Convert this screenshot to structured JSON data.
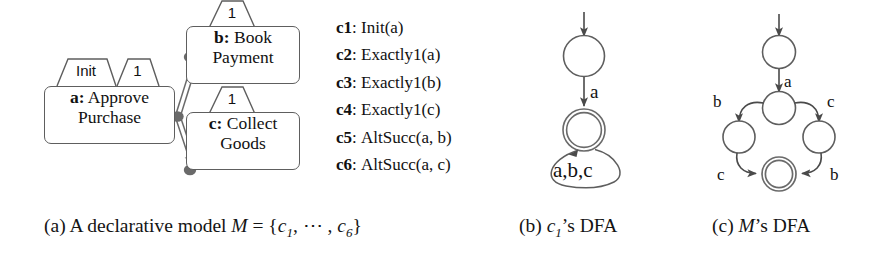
{
  "figure": {
    "background": "#ffffff",
    "line_color": "#5e5e5e",
    "text_color": "#111111"
  },
  "panel_a": {
    "activities": [
      {
        "id": "a",
        "id_label": "a:",
        "line1": " Approve",
        "line2": "Purchase",
        "tabs": [
          "Init",
          "1"
        ]
      },
      {
        "id": "b",
        "id_label": "b:",
        "line1": " Book",
        "line2": "Payment",
        "tabs": [
          "1"
        ]
      },
      {
        "id": "c",
        "id_label": "c:",
        "line1": " Collect",
        "line2": "Goods",
        "tabs": [
          "1"
        ]
      }
    ],
    "relations": [
      {
        "from": "a",
        "to": "b",
        "type": "alternate-succession"
      },
      {
        "from": "a",
        "to": "c",
        "type": "alternate-succession"
      }
    ],
    "constraints": [
      {
        "id": "c1",
        "sep": ":",
        "text": "Init(a)"
      },
      {
        "id": "c2",
        "sep": ":",
        "text": "Exactly1(a)"
      },
      {
        "id": "c3",
        "sep": ":",
        "text": "Exactly1(b)"
      },
      {
        "id": "c4",
        "sep": ":",
        "text": "Exactly1(c)"
      },
      {
        "id": "c5",
        "sep": ":",
        "text": "AltSucc(a, b)"
      },
      {
        "id": "c6",
        "sep": ":",
        "text": "AltSucc(a, c)"
      }
    ]
  },
  "panel_b": {
    "title": "c1's DFA",
    "states": [
      {
        "name": "q0",
        "accepting": false,
        "initial": true
      },
      {
        "name": "q1",
        "accepting": true,
        "initial": false
      }
    ],
    "transitions": [
      {
        "from": "q0",
        "to": "q1",
        "label": "a"
      },
      {
        "from": "q1",
        "to": "q1",
        "label": "a,b,c"
      }
    ]
  },
  "panel_c": {
    "title": "M's DFA",
    "states": [
      {
        "name": "s0",
        "accepting": false,
        "initial": true
      },
      {
        "name": "s1",
        "accepting": false,
        "initial": false
      },
      {
        "name": "s2",
        "accepting": false,
        "initial": false
      },
      {
        "name": "s3",
        "accepting": false,
        "initial": false
      },
      {
        "name": "s4",
        "accepting": true,
        "initial": false
      }
    ],
    "transitions": [
      {
        "from": "s0",
        "to": "s1",
        "label": "a"
      },
      {
        "from": "s1",
        "to": "s2",
        "label": "b"
      },
      {
        "from": "s1",
        "to": "s3",
        "label": "c"
      },
      {
        "from": "s2",
        "to": "s4",
        "label": "c"
      },
      {
        "from": "s3",
        "to": "s4",
        "label": "b"
      }
    ]
  },
  "captions": {
    "a": {
      "tag": "(a)",
      "text": " A declarative model ",
      "model": "M",
      "eq": " = {",
      "c_first": "c",
      "c_first_sub": "1",
      "dots": ", ⋯ , ",
      "c_last": "c",
      "c_last_sub": "6",
      "close": "}"
    },
    "b": {
      "tag": "(b)",
      "c": "c",
      "c_sub": "1",
      "rest": "’s DFA"
    },
    "c": {
      "tag": "(c)",
      "model": "M",
      "rest": "’s DFA"
    }
  }
}
